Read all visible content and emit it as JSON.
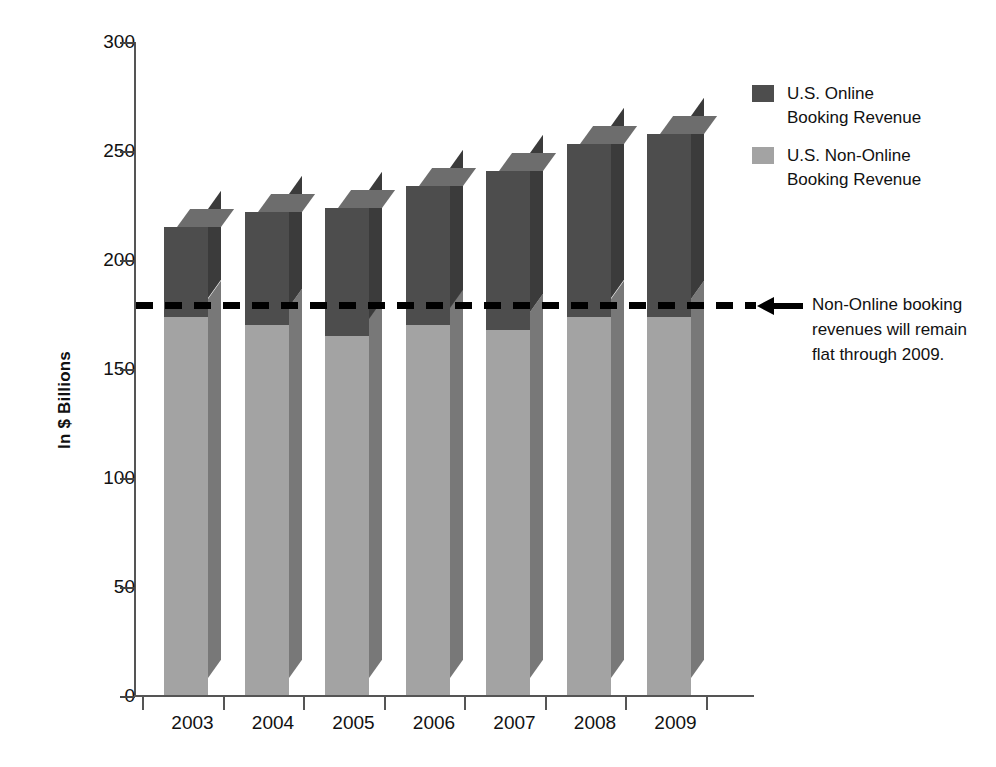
{
  "chart_data": {
    "type": "bar",
    "subtype": "stacked-3d-column",
    "title": "",
    "xlabel": "",
    "ylabel": "In $ Billions",
    "categories": [
      "2003",
      "2004",
      "2005",
      "2006",
      "2007",
      "2008",
      "2009"
    ],
    "series": [
      {
        "name": "U.S. Non-Online Booking Revenue",
        "color": "#a3a3a3",
        "values": [
          174,
          170,
          165,
          170,
          168,
          174,
          174
        ]
      },
      {
        "name": "U.S. Online Booking Revenue",
        "color": "#4d4d4d",
        "values": [
          41,
          52,
          59,
          64,
          73,
          79,
          84
        ]
      }
    ],
    "totals": [
      215,
      222,
      224,
      234,
      241,
      253,
      258
    ],
    "ylim": [
      0,
      300
    ],
    "yticks": [
      0,
      50,
      100,
      150,
      200,
      250,
      300
    ],
    "ytick_labels": [
      "0",
      "50",
      "100",
      "150",
      "200",
      "250",
      "300"
    ],
    "grid": false,
    "legend_position": "right-top",
    "reference_line": {
      "value": 180,
      "style": "dashed",
      "color": "#000000"
    },
    "annotations": [
      {
        "text": "Non-Online booking revenues will remain flat through 2009.",
        "target_value": 180,
        "arrow": "left"
      }
    ]
  },
  "axis": {
    "y_title": "In $ Billions",
    "y_ticks": [
      {
        "label": "300",
        "value": 300
      },
      {
        "label": "250",
        "value": 250
      },
      {
        "label": "200",
        "value": 200
      },
      {
        "label": "150",
        "value": 150
      },
      {
        "label": "100",
        "value": 100
      },
      {
        "label": "50",
        "value": 50
      },
      {
        "label": "0",
        "value": 0
      }
    ],
    "x_ticks": [
      {
        "label": "2003"
      },
      {
        "label": "2004"
      },
      {
        "label": "2005"
      },
      {
        "label": "2006"
      },
      {
        "label": "2007"
      },
      {
        "label": "2008"
      },
      {
        "label": "2009"
      }
    ]
  },
  "legend": {
    "items": [
      {
        "label_line1": "U.S. Online",
        "label_line2": "Booking Revenue",
        "color": "#4d4d4d"
      },
      {
        "label_line1": "U.S. Non-Online",
        "label_line2": "Booking Revenue",
        "color": "#a3a3a3"
      }
    ]
  },
  "annotation": {
    "line1": "Non-Online booking",
    "line2": "revenues will remain",
    "line3": "flat through 2009."
  },
  "colors": {
    "online_front": "#4d4d4d",
    "online_side": "#3b3b3b",
    "online_top": "#6d6d6d",
    "nonline_front": "#a3a3a3",
    "nonline_side": "#787878",
    "axis": "#555555",
    "text": "#111111",
    "reference_line": "#000000",
    "background": "#ffffff"
  }
}
